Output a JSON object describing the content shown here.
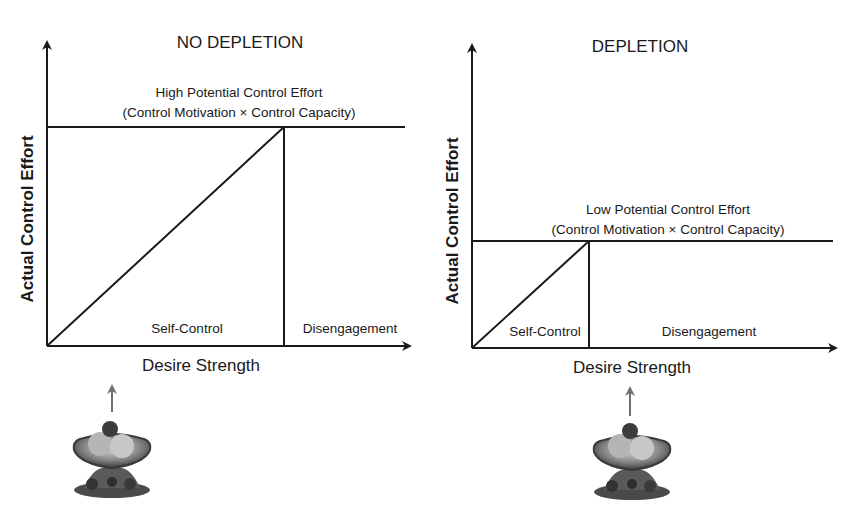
{
  "panels": [
    {
      "id": "no-depletion",
      "title": "NO DEPLETION",
      "potential_label_line1": "High Potential Control Effort",
      "potential_label_line2": "(Control Motivation × Control Capacity)",
      "region_left": "Self-Control",
      "region_right": "Disengagement",
      "x_axis_label": "Desire Strength",
      "y_axis_label": "Actual Control Effort",
      "image_label": "temptation-food-image"
    },
    {
      "id": "depletion",
      "title": "DEPLETION",
      "potential_label_line1": "Low Potential Control Effort",
      "potential_label_line2": "(Control Motivation × Control Capacity)",
      "region_left": "Self-Control",
      "region_right": "Disengagement",
      "x_axis_label": "Desire Strength",
      "y_axis_label": "Actual Control Effort",
      "image_label": "temptation-food-image"
    }
  ],
  "colors": {
    "line": "#1a1a1a",
    "arrow_gray": "#707070",
    "background": "#ffffff"
  }
}
